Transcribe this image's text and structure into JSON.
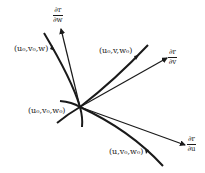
{
  "diagram": {
    "point_label": "(u₀,v₀,w₀)",
    "curves": [
      {
        "name": "w-curve",
        "label": "(u₀,v₀,w)"
      },
      {
        "name": "v-curve",
        "label": "(u₀,v,w₀)"
      },
      {
        "name": "u-curve",
        "label": "(u,v₀,w₀)"
      }
    ],
    "tangents": [
      {
        "name": "dr-dw",
        "num": "∂r",
        "den": "∂w"
      },
      {
        "name": "dr-dv",
        "num": "∂r",
        "den": "∂v"
      },
      {
        "name": "dr-du",
        "num": "∂r",
        "den": "∂u"
      }
    ],
    "colors": {
      "stroke": "#1a1a1a"
    }
  }
}
